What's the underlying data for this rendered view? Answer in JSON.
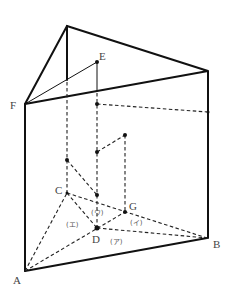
{
  "diagram": {
    "type": "triangular prism with interior points",
    "points": {
      "A": {
        "label": "A",
        "x": 25,
        "y": 271,
        "lx": 13,
        "ly": 284
      },
      "B": {
        "label": "B",
        "x": 207,
        "y": 238,
        "lx": 213,
        "ly": 248
      },
      "C": {
        "label": "C",
        "x": 67,
        "y": 193,
        "lx": 55,
        "ly": 194
      },
      "D": {
        "label": "D",
        "x": 97,
        "y": 228,
        "lx": 92,
        "ly": 243
      },
      "E": {
        "label": "E",
        "x": 97,
        "y": 62,
        "lx": 99,
        "ly": 60
      },
      "F": {
        "label": "F",
        "x": 25,
        "y": 104,
        "lx": 10,
        "ly": 109
      },
      "G": {
        "label": "G",
        "x": 125,
        "y": 212,
        "lx": 129,
        "ly": 210
      }
    },
    "region_labels": [
      {
        "id": "a",
        "text": "(ア)",
        "x": 110,
        "y": 244
      },
      {
        "id": "i",
        "text": "(イ)",
        "x": 130,
        "y": 225
      },
      {
        "id": "u",
        "text": "(ウ)",
        "x": 91,
        "y": 215
      },
      {
        "id": "e",
        "text": "(エ)",
        "x": 66,
        "y": 227
      }
    ]
  }
}
